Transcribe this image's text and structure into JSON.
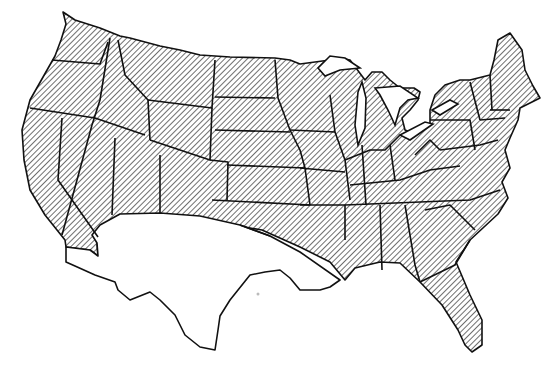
{
  "map": {
    "title": "",
    "subject": "Contiguous United States with state boundaries",
    "legend": [],
    "colors": {
      "outline": "#111111",
      "hatch": "#222222",
      "background": "#ffffff"
    },
    "regions": [
      {
        "name": "hatched-region",
        "description": "Most of the contiguous US (northern and eastern states), diagonal hatch pattern",
        "fill": "hatch"
      },
      {
        "name": "unhatched-region",
        "description": "Southwestern/south-central area south of a curved boundary: southern California, Arizona, New Mexico, Texas, southern Oklahoma, southern Arkansas, most of Louisiana",
        "fill": "none"
      }
    ],
    "boundary_line": "Curved line from southern California east through Oklahoma/Arkansas to the Mississippi gulf coast"
  }
}
